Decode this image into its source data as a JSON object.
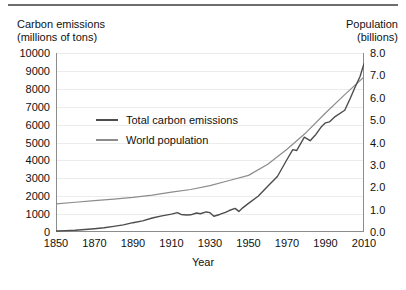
{
  "chart_data": {
    "type": "line",
    "title": "",
    "xlabel": "Year",
    "ylabel": "Carbon emissions\n(millions of tons)",
    "y2label": "Population\n(billions)",
    "left_axis_title_line1": "Carbon emissions",
    "left_axis_title_line2": "(millions of tons)",
    "right_axis_title_line1": "Population",
    "right_axis_title_line2": "(billions)",
    "xlim": [
      1850,
      2010
    ],
    "ylim": [
      0,
      10000
    ],
    "y2lim": [
      0.0,
      8.0
    ],
    "grid": true,
    "legend_position": "upper-left-inside",
    "xticks": [
      "1850",
      "1870",
      "1890",
      "1910",
      "1930",
      "1950",
      "1970",
      "1990",
      "2010"
    ],
    "xtick_values": [
      1850,
      1870,
      1890,
      1910,
      1930,
      1950,
      1970,
      1990,
      2010
    ],
    "yticks_left": [
      "0",
      "1000",
      "2000",
      "3000",
      "4000",
      "5000",
      "6000",
      "7000",
      "8000",
      "9000",
      "10000"
    ],
    "ytick_left_values": [
      0,
      1000,
      2000,
      3000,
      4000,
      5000,
      6000,
      7000,
      8000,
      9000,
      10000
    ],
    "yticks_right": [
      "0.0",
      "1.0",
      "2.0",
      "3.0",
      "4.0",
      "5.0",
      "6.0",
      "7.0",
      "8.0"
    ],
    "ytick_right_values": [
      0.0,
      1.0,
      2.0,
      3.0,
      4.0,
      5.0,
      6.0,
      7.0,
      8.0
    ],
    "colors": {
      "emissions_line": "#4d4d4d",
      "population_line": "#8c8c8c",
      "axis": "#8c8c8c",
      "grid": "#ececec",
      "text": "#111111",
      "top_rule": "#6e6e6e",
      "background": "#ffffff"
    },
    "series": [
      {
        "name": "Total carbon emissions",
        "axis": "left",
        "units": "millions of tons",
        "color": "#4d4d4d",
        "x": [
          1850,
          1855,
          1860,
          1865,
          1870,
          1875,
          1880,
          1885,
          1890,
          1895,
          1900,
          1905,
          1910,
          1913,
          1915,
          1918,
          1920,
          1923,
          1925,
          1928,
          1930,
          1932,
          1935,
          1938,
          1940,
          1943,
          1945,
          1947,
          1950,
          1955,
          1960,
          1965,
          1970,
          1973,
          1975,
          1979,
          1982,
          1985,
          1988,
          1990,
          1992,
          1995,
          2000,
          2003,
          2005,
          2008,
          2010
        ],
        "y": [
          55,
          75,
          100,
          140,
          185,
          240,
          315,
          400,
          520,
          620,
          780,
          900,
          1000,
          1080,
          980,
          950,
          960,
          1060,
          1020,
          1120,
          1080,
          880,
          980,
          1100,
          1200,
          1320,
          1150,
          1350,
          1600,
          2000,
          2550,
          3100,
          4050,
          4600,
          4550,
          5300,
          5100,
          5450,
          5900,
          6100,
          6150,
          6450,
          6800,
          7500,
          8000,
          8700,
          9400
        ]
      },
      {
        "name": "World population",
        "axis": "right",
        "units": "billions",
        "color": "#8c8c8c",
        "x": [
          1850,
          1860,
          1870,
          1880,
          1890,
          1900,
          1910,
          1920,
          1930,
          1940,
          1950,
          1960,
          1970,
          1980,
          1990,
          2000,
          2010
        ],
        "y": [
          1.26,
          1.33,
          1.4,
          1.47,
          1.55,
          1.65,
          1.78,
          1.9,
          2.07,
          2.3,
          2.53,
          3.03,
          3.7,
          4.45,
          5.32,
          6.14,
          6.93
        ]
      }
    ],
    "annotations": [],
    "notes": [
      "Emissions curve shows a dip around World War I (1915-1920) and the Great Depression (1930-1935).",
      "The two curves cross at approximately the year 2000."
    ]
  },
  "legend": {
    "items": [
      {
        "label": "Total carbon emissions",
        "color": "#4d4d4d"
      },
      {
        "label": "World population",
        "color": "#8c8c8c"
      }
    ]
  }
}
